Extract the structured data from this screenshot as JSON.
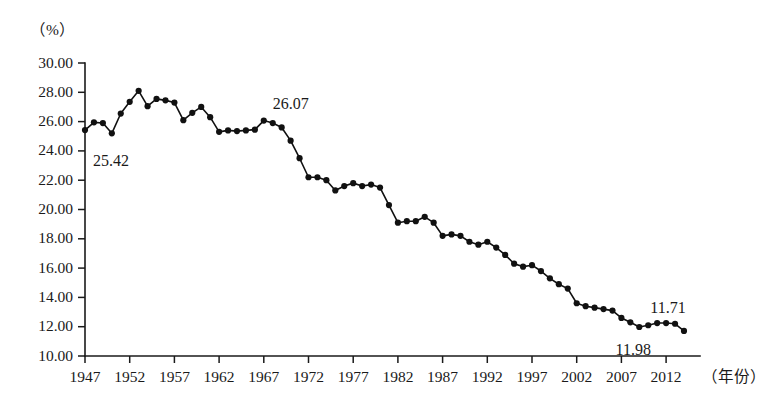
{
  "chart_data": {
    "type": "line",
    "title": "",
    "subtitle": "",
    "xlabel": "（年份）",
    "ylabel": "",
    "unit_label": "（%）",
    "xlim": [
      1947,
      2014
    ],
    "ylim": [
      10.0,
      30.0
    ],
    "grid": false,
    "legend": null,
    "y_ticks": [
      "30.00",
      "28.00",
      "26.00",
      "24.00",
      "22.00",
      "20.00",
      "18.00",
      "16.00",
      "14.00",
      "12.00",
      "10.00"
    ],
    "y_tick_values": [
      30.0,
      28.0,
      26.0,
      24.0,
      22.0,
      20.0,
      18.0,
      16.0,
      14.0,
      12.0,
      10.0
    ],
    "x_ticks": [
      "1947",
      "1952",
      "1957",
      "1962",
      "1967",
      "1972",
      "1977",
      "1982",
      "1987",
      "1992",
      "1997",
      "2002",
      "2007",
      "2012"
    ],
    "x_tick_values": [
      1947,
      1952,
      1957,
      1962,
      1967,
      1972,
      1977,
      1982,
      1987,
      1992,
      1997,
      2002,
      2007,
      2012
    ],
    "series": [
      {
        "name": "比重",
        "color": "#111111",
        "x": [
          1947,
          1948,
          1949,
          1950,
          1951,
          1952,
          1953,
          1954,
          1955,
          1956,
          1957,
          1958,
          1959,
          1960,
          1961,
          1962,
          1963,
          1964,
          1965,
          1966,
          1967,
          1968,
          1969,
          1970,
          1971,
          1972,
          1973,
          1974,
          1975,
          1976,
          1977,
          1978,
          1979,
          1980,
          1981,
          1982,
          1983,
          1984,
          1985,
          1986,
          1987,
          1988,
          1989,
          1990,
          1991,
          1992,
          1993,
          1994,
          1995,
          1996,
          1997,
          1998,
          1999,
          2000,
          2001,
          2002,
          2003,
          2004,
          2005,
          2006,
          2007,
          2008,
          2009,
          2010,
          2011,
          2012,
          2013,
          2014
        ],
        "values": [
          25.42,
          25.95,
          25.9,
          25.2,
          26.55,
          27.35,
          28.1,
          27.05,
          27.55,
          27.45,
          27.3,
          26.1,
          26.6,
          27.0,
          26.3,
          25.3,
          25.4,
          25.35,
          25.4,
          25.45,
          26.07,
          25.9,
          25.6,
          24.7,
          23.5,
          22.2,
          22.2,
          22.0,
          21.3,
          21.6,
          21.8,
          21.6,
          21.7,
          21.5,
          20.3,
          19.1,
          19.2,
          19.2,
          19.5,
          19.1,
          18.2,
          18.3,
          18.2,
          17.8,
          17.6,
          17.8,
          17.4,
          16.9,
          16.3,
          16.1,
          16.2,
          15.8,
          15.3,
          14.9,
          14.6,
          13.6,
          13.4,
          13.3,
          13.2,
          13.1,
          12.6,
          12.3,
          11.98,
          12.1,
          12.25,
          12.25,
          12.2,
          11.71
        ]
      }
    ],
    "annotations": [
      {
        "label": "25.42",
        "x": 1947,
        "y": 25.42,
        "dx": 26,
        "dy": 36
      },
      {
        "label": "26.07",
        "x": 1967,
        "y": 26.07,
        "dx": 27,
        "dy": -12
      },
      {
        "label": "11.98",
        "x": 2009,
        "y": 11.98,
        "dx": -6,
        "dy": 28
      },
      {
        "label": "11.71",
        "x": 2014,
        "y": 11.71,
        "dx": -16,
        "dy": -18
      }
    ]
  },
  "figure": {
    "caption": ""
  }
}
